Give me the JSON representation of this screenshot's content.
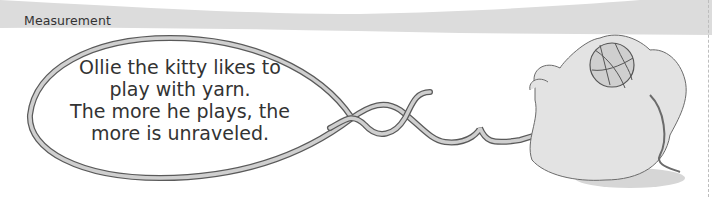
{
  "header": {
    "section_label": "Measurement",
    "band_color": "#dcdcdc"
  },
  "speech_bubble": {
    "lines": [
      "Ollie the kitty likes to",
      "play with yarn.",
      "The more he plays, the",
      "more is unraveled."
    ],
    "outline_color": "#6b6b6b",
    "fill_color": "#cfcfcf"
  },
  "illustration": {
    "subject": "kitten-playing-with-yarn-ball",
    "body_color": "#e3e3e3",
    "shadow_color": "#d6d6d6",
    "yarn_color": "#bdbdbd"
  }
}
